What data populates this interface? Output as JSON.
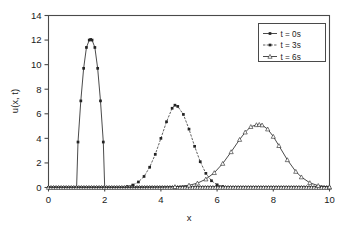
{
  "chart_data": {
    "type": "line",
    "title": "",
    "xlabel": "x",
    "ylabel": "u(x, t)",
    "xlim": [
      0,
      10
    ],
    "ylim": [
      0,
      14
    ],
    "xticks": [
      0,
      2,
      4,
      6,
      8,
      10
    ],
    "yticks": [
      0,
      2,
      4,
      6,
      8,
      10,
      12,
      14
    ],
    "grid": false,
    "legend_position": "top-right",
    "series": [
      {
        "name": "t = 0s",
        "marker": "filled-square",
        "line": "solid",
        "color": "#2b2b2b",
        "peak_x": 1.5,
        "peak_y": 12.0,
        "x": [
          0.0,
          0.2,
          0.4,
          0.6,
          0.8,
          1.0,
          1.05,
          1.15,
          1.25,
          1.35,
          1.45,
          1.5,
          1.55,
          1.65,
          1.75,
          1.85,
          1.95,
          2.0,
          2.2,
          2.4,
          2.6,
          2.8,
          3.0,
          3.5,
          4.0,
          4.5,
          5.0,
          5.5,
          6.0,
          6.5,
          7.0,
          7.5,
          8.0,
          8.5,
          9.0,
          9.5,
          10.0
        ],
        "y": [
          0.0,
          0.0,
          0.0,
          0.0,
          0.0,
          0.0,
          3.7,
          7.05,
          9.7,
          11.4,
          12.0,
          12.05,
          12.0,
          11.4,
          9.7,
          7.05,
          3.7,
          0.0,
          0.0,
          0.0,
          0.0,
          0.0,
          0.0,
          0.0,
          0.0,
          0.0,
          0.0,
          0.0,
          0.0,
          0.0,
          0.0,
          0.0,
          0.0,
          0.0,
          0.0,
          0.0,
          0.0
        ]
      },
      {
        "name": "t = 3s",
        "marker": "filled-square",
        "line": "dash-dot",
        "color": "#2b2b2b",
        "peak_x": 4.5,
        "peak_y": 6.7,
        "x": [
          0.0,
          0.5,
          1.0,
          1.5,
          2.0,
          2.5,
          2.8,
          3.0,
          3.2,
          3.4,
          3.6,
          3.8,
          4.0,
          4.2,
          4.4,
          4.5,
          4.6,
          4.8,
          5.0,
          5.2,
          5.4,
          5.6,
          5.8,
          6.0,
          6.2,
          6.5,
          7.0,
          7.5,
          8.0,
          8.5,
          9.0,
          9.5,
          10.0
        ],
        "y": [
          0.0,
          0.0,
          0.0,
          0.0,
          0.0,
          0.02,
          0.08,
          0.2,
          0.45,
          0.9,
          1.65,
          2.7,
          4.0,
          5.35,
          6.45,
          6.7,
          6.6,
          5.95,
          4.75,
          3.35,
          2.1,
          1.15,
          0.55,
          0.22,
          0.08,
          0.02,
          0.0,
          0.0,
          0.0,
          0.0,
          0.0,
          0.0,
          0.0
        ]
      },
      {
        "name": "t = 6s",
        "marker": "open-triangle",
        "line": "solid",
        "color": "#2b2b2b",
        "peak_x": 7.5,
        "peak_y": 5.1,
        "x": [
          0.0,
          1.0,
          2.0,
          3.0,
          4.0,
          4.5,
          5.0,
          5.3,
          5.6,
          5.9,
          6.2,
          6.5,
          6.8,
          7.0,
          7.2,
          7.4,
          7.5,
          7.6,
          7.8,
          8.0,
          8.2,
          8.5,
          8.8,
          9.0,
          9.3,
          9.6,
          10.0
        ],
        "y": [
          0.0,
          0.0,
          0.0,
          0.0,
          0.02,
          0.06,
          0.18,
          0.35,
          0.68,
          1.2,
          1.95,
          2.9,
          3.9,
          4.5,
          4.95,
          5.1,
          5.12,
          5.08,
          4.75,
          4.15,
          3.4,
          2.25,
          1.3,
          0.85,
          0.38,
          0.15,
          0.04
        ]
      }
    ]
  },
  "legend": {
    "entries": [
      {
        "label": "t = 0s"
      },
      {
        "label": "t = 3s"
      },
      {
        "label": "t = 6s"
      }
    ]
  },
  "axes": {
    "x_label": "x",
    "y_label": "u(x, t)",
    "x_tick_labels": [
      "0",
      "2",
      "4",
      "6",
      "8",
      "10"
    ],
    "y_tick_labels": [
      "0",
      "2",
      "4",
      "6",
      "8",
      "10",
      "12",
      "14"
    ]
  }
}
